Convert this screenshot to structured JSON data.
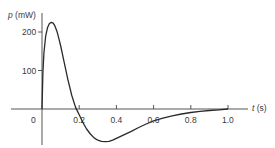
{
  "chart_data": {
    "type": "line",
    "title": "",
    "xlabel": "t (s)",
    "ylabel": "p (mW)",
    "xlabel_var": "t",
    "xlabel_unit": "(s)",
    "ylabel_var": "p",
    "ylabel_unit": "(mW)",
    "xlim": [
      -0.17,
      1.1
    ],
    "ylim": [
      -100,
      250
    ],
    "grid": false,
    "legend": null,
    "x_ticks": [
      0.2,
      0.4,
      0.6,
      0.8,
      1.0
    ],
    "x_tick_labels": [
      "0.2",
      "0.4",
      "0.6",
      "0.8",
      "1.0"
    ],
    "origin_label": "0",
    "y_ticks": [
      100,
      200
    ],
    "y_tick_labels": [
      "100",
      "200"
    ],
    "series": [
      {
        "name": "p(t)",
        "color": "#2a2a2a",
        "x": [
          0.0,
          0.005,
          0.01,
          0.02,
          0.03,
          0.04,
          0.05,
          0.06,
          0.07,
          0.08,
          0.09,
          0.1,
          0.12,
          0.14,
          0.16,
          0.18,
          0.19,
          0.2,
          0.22,
          0.24,
          0.26,
          0.28,
          0.3,
          0.32,
          0.34,
          0.36,
          0.38,
          0.4,
          0.44,
          0.48,
          0.52,
          0.56,
          0.6,
          0.65,
          0.7,
          0.75,
          0.8,
          0.85,
          0.9,
          0.95,
          1.0
        ],
        "values": [
          0,
          95,
          145,
          190,
          212,
          222,
          225,
          223,
          215,
          202,
          185,
          165,
          120,
          75,
          35,
          5,
          -5,
          -15,
          -35,
          -52,
          -65,
          -75,
          -81,
          -84,
          -85,
          -84,
          -81,
          -76,
          -67,
          -58,
          -48,
          -39,
          -31,
          -24,
          -18,
          -13,
          -9,
          -6,
          -4,
          -2,
          0
        ]
      }
    ]
  }
}
